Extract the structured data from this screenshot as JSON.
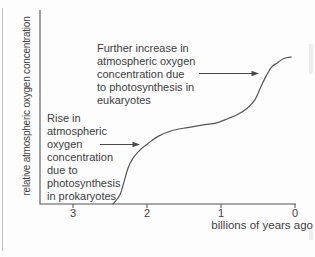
{
  "figure": {
    "y_axis_label": "relative atmospheric oxygen concentration",
    "x_axis_label": "billions of years ago",
    "annotations": {
      "eukaryotes": "Further increase in\natmospheric oxygen\nconcentration due\nto photosynthesis in\neukaryotes",
      "prokaryotes": "Rise in\natmospheric\noxygen\nconcentration\ndue to\nphotosynthesis\nin prokaryotes"
    },
    "colors": {
      "ink": "#404040",
      "line": "#555555",
      "page_border": "#a9a9a9",
      "background": "#fdfdfd"
    }
  },
  "chart_data": {
    "type": "line",
    "title": "",
    "xlabel": "billions of years ago",
    "ylabel": "relative atmospheric oxygen concentration",
    "x_axis_reversed": true,
    "xlim": [
      3.45,
      0
    ],
    "x_ticks": [
      3,
      2,
      1,
      0
    ],
    "ylim": [
      0,
      1.05
    ],
    "y_ticks": [],
    "grid": false,
    "legend": "none",
    "series": [
      {
        "name": "relative atmospheric oxygen concentration",
        "points": [
          {
            "x": 2.46,
            "y": 0.0
          },
          {
            "x": 2.36,
            "y": 0.07
          },
          {
            "x": 2.26,
            "y": 0.24
          },
          {
            "x": 2.19,
            "y": 0.31
          },
          {
            "x": 2.09,
            "y": 0.37
          },
          {
            "x": 1.99,
            "y": 0.41
          },
          {
            "x": 1.85,
            "y": 0.46
          },
          {
            "x": 1.66,
            "y": 0.5
          },
          {
            "x": 1.45,
            "y": 0.52
          },
          {
            "x": 1.22,
            "y": 0.54
          },
          {
            "x": 1.07,
            "y": 0.55
          },
          {
            "x": 0.91,
            "y": 0.58
          },
          {
            "x": 0.77,
            "y": 0.61
          },
          {
            "x": 0.65,
            "y": 0.65
          },
          {
            "x": 0.54,
            "y": 0.71
          },
          {
            "x": 0.46,
            "y": 0.8
          },
          {
            "x": 0.39,
            "y": 0.87
          },
          {
            "x": 0.32,
            "y": 0.93
          },
          {
            "x": 0.24,
            "y": 0.96
          },
          {
            "x": 0.15,
            "y": 0.99
          },
          {
            "x": 0.05,
            "y": 1.0
          }
        ]
      }
    ],
    "annotations": [
      {
        "text": "Rise in atmospheric oxygen concentration due to photosynthesis in prokaryotes",
        "arrow_points_to": {
          "x": 2.1,
          "y": 0.4
        }
      },
      {
        "text": "Further increase in atmospheric oxygen concentration due to photosynthesis in eukaryotes",
        "arrow_points_to": {
          "x": 0.49,
          "y": 0.89
        }
      }
    ]
  }
}
